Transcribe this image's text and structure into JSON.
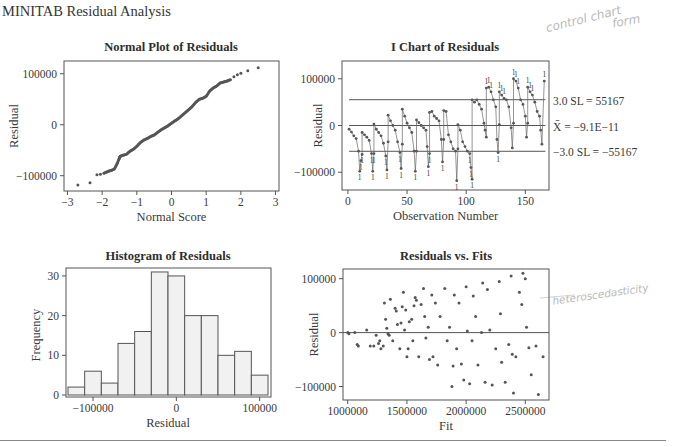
{
  "page": {
    "title": "MINITAB Residual Analysis",
    "annotations": {
      "top_right": [
        "control chart",
        "form"
      ],
      "bottom_right": "heteroscedasticity"
    }
  },
  "chart_data": [
    {
      "id": "normal_plot",
      "type": "scatter",
      "title": "Normal Plot of Residuals",
      "xlabel": "Normal Score",
      "ylabel": "Residual",
      "xlim": [
        -3.1,
        3.1
      ],
      "ylim": [
        -130000,
        125000
      ],
      "xticks": [
        -3,
        -2,
        -1,
        0,
        1,
        2,
        3
      ],
      "yticks": [
        -100000,
        0,
        100000
      ],
      "grid": false,
      "description": "Approximately 170 residuals plotted against normal scores, nearly linear from (-2.7, -118000) to (2.5, 112000), with a step near -1.6",
      "points_sample": [
        [
          -2.7,
          -118000
        ],
        [
          -2.35,
          -114000
        ],
        [
          -2.15,
          -98000
        ],
        [
          -2.05,
          -97000
        ],
        [
          -1.95,
          -95000
        ],
        [
          -1.85,
          -92000
        ],
        [
          -1.75,
          -90000
        ],
        [
          -1.65,
          -87000
        ],
        [
          -1.58,
          -78000
        ],
        [
          -1.52,
          -68000
        ],
        [
          -1.48,
          -62000
        ],
        [
          -1.4,
          -60000
        ],
        [
          -1.3,
          -58000
        ],
        [
          -1.2,
          -52000
        ],
        [
          -1.1,
          -48000
        ],
        [
          -1.0,
          -42000
        ],
        [
          -0.9,
          -35000
        ],
        [
          -0.8,
          -30000
        ],
        [
          -0.7,
          -27000
        ],
        [
          -0.6,
          -23000
        ],
        [
          -0.5,
          -20000
        ],
        [
          -0.4,
          -15000
        ],
        [
          -0.3,
          -10000
        ],
        [
          -0.2,
          -6000
        ],
        [
          -0.1,
          -2000
        ],
        [
          0.0,
          3000
        ],
        [
          0.1,
          8000
        ],
        [
          0.2,
          12000
        ],
        [
          0.3,
          18000
        ],
        [
          0.4,
          24000
        ],
        [
          0.5,
          30000
        ],
        [
          0.6,
          36000
        ],
        [
          0.7,
          44000
        ],
        [
          0.8,
          50000
        ],
        [
          0.9,
          52000
        ],
        [
          1.0,
          56000
        ],
        [
          1.1,
          66000
        ],
        [
          1.2,
          72000
        ],
        [
          1.3,
          76000
        ],
        [
          1.4,
          82000
        ],
        [
          1.5,
          84000
        ],
        [
          1.6,
          86000
        ],
        [
          1.7,
          88000
        ],
        [
          1.8,
          94000
        ],
        [
          1.9,
          98000
        ],
        [
          2.0,
          101000
        ],
        [
          2.2,
          106000
        ],
        [
          2.5,
          112000
        ]
      ]
    },
    {
      "id": "i_chart",
      "type": "line",
      "title": "I Chart of Residuals",
      "xlabel": "Observation Number",
      "ylabel": "Residual",
      "xlim": [
        -5,
        170
      ],
      "ylim": [
        -138000,
        138000
      ],
      "xticks": [
        0,
        50,
        100,
        150
      ],
      "yticks": [
        -100000,
        0,
        100000
      ],
      "control_limits": {
        "ucl": {
          "label": "3.0 SL = 55167",
          "value": 55167
        },
        "center": {
          "label": "X̄ = −9.1E−11",
          "value": 0
        },
        "lcl": {
          "label": "−3.0 SL = −55167",
          "value": -55167
        }
      },
      "description": "Sawtooth pattern of ~167 residuals; each segment starts high and decays; observations after ~105 shifted upward. Points outside limits marked with test numbers (1, 2, 3, 5, 6, 8).",
      "segments": [
        {
          "x": [
            1,
            3,
            5,
            7,
            9,
            10,
            11,
            12
          ],
          "y": [
            -8000,
            -14000,
            -22000,
            -28000,
            -55000,
            -98000,
            -75000,
            -62000
          ]
        },
        {
          "x": [
            12,
            14,
            16,
            18,
            20,
            21,
            22
          ],
          "y": [
            -15000,
            -20000,
            -25000,
            -32000,
            -60000,
            -98000,
            -60000
          ]
        },
        {
          "x": [
            22,
            24,
            26,
            28,
            30,
            32,
            33,
            34
          ],
          "y": [
            3000,
            -8000,
            -15000,
            -22000,
            -38000,
            -65000,
            -95000,
            -35000
          ]
        },
        {
          "x": [
            34,
            36,
            38,
            40,
            42,
            44,
            45,
            46
          ],
          "y": [
            22000,
            10000,
            0,
            -10000,
            -35000,
            -58000,
            -92000,
            -40000
          ]
        },
        {
          "x": [
            46,
            48,
            50,
            52,
            54,
            56,
            57,
            58
          ],
          "y": [
            35000,
            20000,
            5000,
            -5000,
            -15000,
            -55000,
            -98000,
            -55000
          ]
        },
        {
          "x": [
            58,
            60,
            62,
            64,
            66,
            67,
            68,
            69
          ],
          "y": [
            12000,
            6000,
            0,
            -5000,
            -10000,
            -45000,
            -88000,
            -60000
          ]
        },
        {
          "x": [
            69,
            71,
            73,
            75,
            77,
            79,
            80,
            81
          ],
          "y": [
            28000,
            30000,
            20000,
            15000,
            10000,
            -30000,
            -78000,
            -30000
          ]
        },
        {
          "x": [
            81,
            83,
            85,
            87,
            89,
            91,
            92,
            93
          ],
          "y": [
            32000,
            30000,
            -20000,
            -35000,
            -50000,
            -55000,
            -118000,
            -50000
          ]
        },
        {
          "x": [
            93,
            95,
            97,
            99,
            101,
            103,
            104,
            105
          ],
          "y": [
            2000,
            -10000,
            -35000,
            -45000,
            -55000,
            -60000,
            -90000,
            -115000
          ]
        },
        {
          "x": [
            105,
            107,
            109,
            111,
            113,
            115,
            116,
            117
          ],
          "y": [
            55000,
            50000,
            55000,
            45000,
            35000,
            5000,
            -10000,
            -25000
          ]
        },
        {
          "x": [
            117,
            119,
            121,
            123,
            125,
            126,
            127,
            128
          ],
          "y": [
            80000,
            82000,
            72000,
            55000,
            40000,
            -30000,
            -58000,
            2000
          ]
        },
        {
          "x": [
            128,
            130,
            132,
            134,
            136,
            138,
            139,
            140
          ],
          "y": [
            72000,
            65000,
            58000,
            55000,
            40000,
            -5000,
            -48000,
            5000
          ]
        },
        {
          "x": [
            140,
            142,
            144,
            146,
            148,
            150,
            151,
            152
          ],
          "y": [
            100000,
            95000,
            80000,
            55000,
            45000,
            20000,
            -25000,
            5000
          ]
        },
        {
          "x": [
            152,
            154,
            156,
            158,
            160,
            162,
            163,
            164,
            166
          ],
          "y": [
            82000,
            72000,
            65000,
            50000,
            30000,
            20000,
            -10000,
            -40000,
            95000
          ]
        }
      ]
    },
    {
      "id": "histogram",
      "type": "bar",
      "title": "Histogram of Residuals",
      "xlabel": "Residual",
      "ylabel": "Frequency",
      "xlim": [
        -130000,
        110000
      ],
      "ylim": [
        0,
        32
      ],
      "xticks": [
        -100000,
        0,
        100000
      ],
      "yticks": [
        0,
        10,
        20,
        30
      ],
      "bin_edges": [
        -130000,
        -110000,
        -90000,
        -70000,
        -50000,
        -30000,
        -10000,
        10000,
        30000,
        50000,
        70000,
        90000,
        110000
      ],
      "categories": [
        "-120000",
        "-100000",
        "-80000",
        "-60000",
        "-40000",
        "-20000",
        "0",
        "20000",
        "40000",
        "60000",
        "80000",
        "100000"
      ],
      "values": [
        2,
        6,
        3,
        13,
        16,
        31,
        30,
        20,
        20,
        10,
        11,
        5
      ]
    },
    {
      "id": "residuals_vs_fits",
      "type": "scatter",
      "title": "Residuals vs. Fits",
      "xlabel": "Fit",
      "ylabel": "Residual",
      "xlim": [
        960000,
        2700000
      ],
      "ylim": [
        -125000,
        118000
      ],
      "xticks": [
        1000000,
        1500000,
        2000000,
        2500000
      ],
      "yticks": [
        -100000,
        0,
        100000
      ],
      "reference_line": 0,
      "description": "Residual spread increases with fitted value (funnel shape)",
      "points_sample": [
        [
          1000000,
          0
        ],
        [
          1010000,
          -2000
        ],
        [
          1060000,
          0
        ],
        [
          1080000,
          -22000
        ],
        [
          1090000,
          -25000
        ],
        [
          1160000,
          5000
        ],
        [
          1190000,
          -25000
        ],
        [
          1220000,
          -25000
        ],
        [
          1240000,
          -5000
        ],
        [
          1260000,
          -20000
        ],
        [
          1270000,
          -15000
        ],
        [
          1280000,
          -30000
        ],
        [
          1300000,
          -25000
        ],
        [
          1310000,
          55000
        ],
        [
          1320000,
          25000
        ],
        [
          1330000,
          8000
        ],
        [
          1340000,
          -2000
        ],
        [
          1350000,
          -5000
        ],
        [
          1360000,
          62000
        ],
        [
          1380000,
          -15000
        ],
        [
          1400000,
          45000
        ],
        [
          1410000,
          40000
        ],
        [
          1420000,
          15000
        ],
        [
          1440000,
          -30000
        ],
        [
          1450000,
          18000
        ],
        [
          1460000,
          48000
        ],
        [
          1470000,
          75000
        ],
        [
          1480000,
          5000
        ],
        [
          1490000,
          42000
        ],
        [
          1500000,
          -45000
        ],
        [
          1510000,
          -30000
        ],
        [
          1520000,
          20000
        ],
        [
          1540000,
          25000
        ],
        [
          1550000,
          -15000
        ],
        [
          1560000,
          50000
        ],
        [
          1570000,
          65000
        ],
        [
          1580000,
          60000
        ],
        [
          1600000,
          -45000
        ],
        [
          1620000,
          52000
        ],
        [
          1640000,
          82000
        ],
        [
          1650000,
          30000
        ],
        [
          1660000,
          -10000
        ],
        [
          1680000,
          10000
        ],
        [
          1690000,
          -50000
        ],
        [
          1710000,
          70000
        ],
        [
          1720000,
          -45000
        ],
        [
          1740000,
          55000
        ],
        [
          1760000,
          -60000
        ],
        [
          1780000,
          30000
        ],
        [
          1820000,
          82000
        ],
        [
          1840000,
          -15000
        ],
        [
          1860000,
          10000
        ],
        [
          1880000,
          -100000
        ],
        [
          1890000,
          -62000
        ],
        [
          1900000,
          70000
        ],
        [
          1920000,
          -30000
        ],
        [
          1940000,
          55000
        ],
        [
          1960000,
          -58000
        ],
        [
          1980000,
          -88000
        ],
        [
          2000000,
          85000
        ],
        [
          2010000,
          3000
        ],
        [
          2030000,
          -95000
        ],
        [
          2050000,
          -15000
        ],
        [
          2060000,
          68000
        ],
        [
          2080000,
          30000
        ],
        [
          2100000,
          -60000
        ],
        [
          2130000,
          0
        ],
        [
          2140000,
          92000
        ],
        [
          2160000,
          -92000
        ],
        [
          2180000,
          80000
        ],
        [
          2200000,
          5000
        ],
        [
          2220000,
          -97000
        ],
        [
          2250000,
          -30000
        ],
        [
          2280000,
          95000
        ],
        [
          2290000,
          35000
        ],
        [
          2300000,
          -55000
        ],
        [
          2330000,
          -92000
        ],
        [
          2360000,
          -22000
        ],
        [
          2380000,
          105000
        ],
        [
          2390000,
          -40000
        ],
        [
          2400000,
          -112000
        ],
        [
          2420000,
          -45000
        ],
        [
          2450000,
          75000
        ],
        [
          2470000,
          52000
        ],
        [
          2480000,
          110000
        ],
        [
          2500000,
          100000
        ],
        [
          2510000,
          10000
        ],
        [
          2530000,
          -28000
        ],
        [
          2550000,
          -78000
        ],
        [
          2590000,
          -25000
        ],
        [
          2610000,
          -115000
        ],
        [
          2650000,
          -45000
        ]
      ]
    }
  ]
}
